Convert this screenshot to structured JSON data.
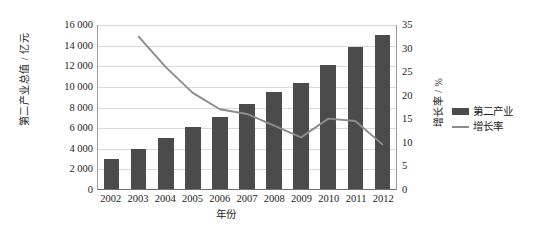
{
  "chart_data": {
    "type": "bar",
    "title": "",
    "subtitle": "",
    "xlabel": "年份",
    "ylabel": "第二产业总值 / 亿元",
    "y2label": "增长率 / %",
    "categories": [
      "2002",
      "2003",
      "2004",
      "2005",
      "2006",
      "2007",
      "2008",
      "2009",
      "2010",
      "2011",
      "2012"
    ],
    "ylim": [
      0,
      16000
    ],
    "y2lim": [
      0,
      35
    ],
    "yticks": [
      "0",
      "2 000",
      "4 000",
      "6 000",
      "8 000",
      "10 000",
      "12 000",
      "14 000",
      "16 000"
    ],
    "ytick_values": [
      0,
      2000,
      4000,
      6000,
      8000,
      10000,
      12000,
      14000,
      16000
    ],
    "y2ticks": [
      "0",
      "5",
      "10",
      "15",
      "20",
      "25",
      "30",
      "35"
    ],
    "y2tick_values": [
      0,
      5,
      10,
      15,
      20,
      25,
      30,
      35
    ],
    "grid": true,
    "legend_position": "right",
    "series": [
      {
        "name": "第二产业",
        "type": "bar",
        "axis": "left",
        "color": "#4b4b4b",
        "values": [
          2900,
          3900,
          4900,
          6000,
          7000,
          8200,
          9400,
          10300,
          12000,
          13800,
          14900
        ]
      },
      {
        "name": "增长率",
        "type": "line",
        "axis": "right",
        "color": "#8c8c8c",
        "values": [
          null,
          32.5,
          26.0,
          20.5,
          17.0,
          16.0,
          13.5,
          11.0,
          15.0,
          14.5,
          9.5
        ]
      }
    ]
  },
  "axes": {
    "left_title": "第二产业总值 / 亿元",
    "right_title": "增长率 / %",
    "bottom_title": "年份"
  },
  "legend": {
    "items": [
      {
        "label": "第二产业",
        "marker": "bar-swatch",
        "color": "#4b4b4b"
      },
      {
        "label": "增长率",
        "marker": "line-swatch",
        "color": "#8c8c8c"
      }
    ]
  }
}
